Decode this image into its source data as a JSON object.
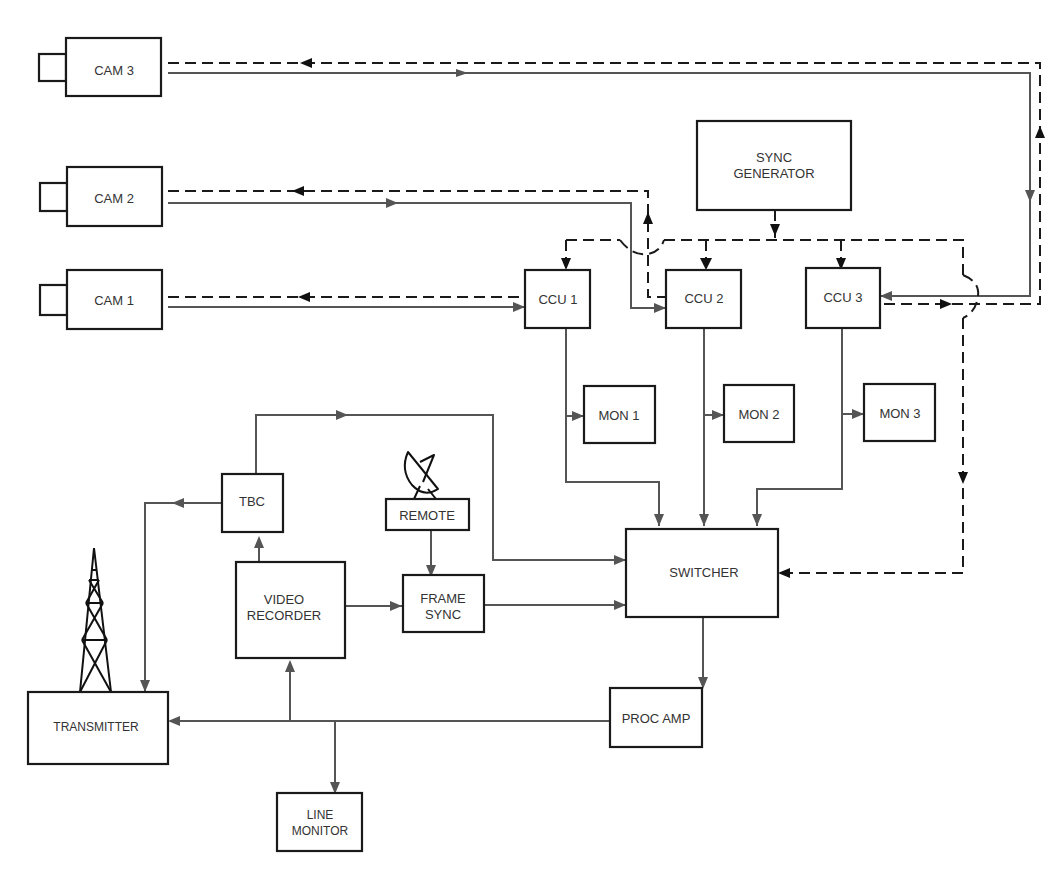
{
  "diagram": {
    "blocks": {
      "cam3": "CAM 3",
      "cam2": "CAM 2",
      "cam1": "CAM 1",
      "sync_generator_line1": "SYNC",
      "sync_generator_line2": "GENERATOR",
      "ccu1": "CCU 1",
      "ccu2": "CCU 2",
      "ccu3": "CCU 3",
      "mon1": "MON 1",
      "mon2": "MON 2",
      "mon3": "MON 3",
      "tbc": "TBC",
      "remote": "REMOTE",
      "video_recorder_line1": "VIDEO",
      "video_recorder_line2": "RECORDER",
      "frame_sync_line1": "FRAME",
      "frame_sync_line2": "SYNC",
      "switcher": "SWITCHER",
      "proc_amp": "PROC AMP",
      "transmitter": "TRANSMITTER",
      "line_monitor_line1": "LINE",
      "line_monitor_line2": "MONITOR"
    },
    "icons": {
      "camera_lens": "camera-lens-icon",
      "satellite_dish": "satellite-dish-icon",
      "transmission_tower": "transmission-tower-icon"
    },
    "legend": {
      "solid_line": "video signal",
      "dashed_line": "sync signal"
    },
    "connections": [
      {
        "from": "CAM 3",
        "to": "CCU 3",
        "type": "video"
      },
      {
        "from": "CCU 3",
        "to": "CAM 3",
        "type": "sync"
      },
      {
        "from": "CAM 2",
        "to": "CCU 2",
        "type": "video"
      },
      {
        "from": "CCU 2",
        "to": "CAM 2",
        "type": "sync"
      },
      {
        "from": "CAM 1",
        "to": "CCU 1",
        "type": "video"
      },
      {
        "from": "CCU 1",
        "to": "CAM 1",
        "type": "sync"
      },
      {
        "from": "SYNC GENERATOR",
        "to": "CCU 1",
        "type": "sync"
      },
      {
        "from": "SYNC GENERATOR",
        "to": "CCU 2",
        "type": "sync"
      },
      {
        "from": "SYNC GENERATOR",
        "to": "CCU 3",
        "type": "sync"
      },
      {
        "from": "SYNC GENERATOR",
        "to": "SWITCHER",
        "type": "sync"
      },
      {
        "from": "CCU 1",
        "to": "MON 1",
        "type": "video"
      },
      {
        "from": "CCU 2",
        "to": "MON 2",
        "type": "video"
      },
      {
        "from": "CCU 3",
        "to": "MON 3",
        "type": "video"
      },
      {
        "from": "CCU 1",
        "to": "SWITCHER",
        "type": "video"
      },
      {
        "from": "CCU 2",
        "to": "SWITCHER",
        "type": "video"
      },
      {
        "from": "CCU 3",
        "to": "SWITCHER",
        "type": "video"
      },
      {
        "from": "TBC",
        "to": "SWITCHER",
        "type": "video"
      },
      {
        "from": "TBC",
        "to": "TRANSMITTER",
        "type": "video"
      },
      {
        "from": "VIDEO RECORDER",
        "to": "TBC",
        "type": "video"
      },
      {
        "from": "VIDEO RECORDER",
        "to": "FRAME SYNC",
        "type": "video"
      },
      {
        "from": "REMOTE",
        "to": "FRAME SYNC",
        "type": "video"
      },
      {
        "from": "FRAME SYNC",
        "to": "SWITCHER",
        "type": "video"
      },
      {
        "from": "SWITCHER",
        "to": "PROC AMP",
        "type": "video"
      },
      {
        "from": "PROC AMP",
        "to": "TRANSMITTER",
        "type": "video"
      },
      {
        "from": "PROC AMP",
        "to": "VIDEO RECORDER",
        "type": "video"
      },
      {
        "from": "PROC AMP",
        "to": "LINE MONITOR",
        "type": "video"
      }
    ],
    "colors": {
      "block_stroke": "#1a1a1a",
      "video_line": "#555555",
      "sync_line": "#1a1a1a",
      "text": "#333333",
      "background": "#ffffff"
    }
  }
}
